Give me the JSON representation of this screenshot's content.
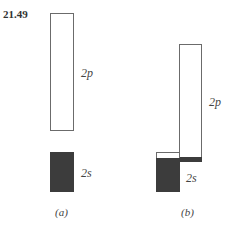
{
  "problem_number": "21.49",
  "panels": [
    {
      "caption": "(a)",
      "levels": [
        {
          "label": "2p",
          "state": "empty"
        },
        {
          "label": "2s",
          "state": "filled"
        }
      ]
    },
    {
      "caption": "(b)",
      "levels": [
        {
          "label": "2p",
          "state": "partially filled at bottom"
        },
        {
          "label": "2s",
          "state": "mostly filled, empty at top"
        }
      ]
    }
  ],
  "colors": {
    "filled": "#3c3c3c",
    "outline": "#6b6b6b"
  }
}
